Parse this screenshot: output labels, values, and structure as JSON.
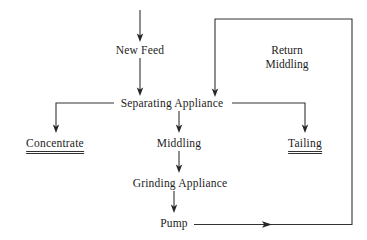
{
  "diagram": {
    "type": "flowchart",
    "background_color": "#ffffff",
    "line_color": "#333333",
    "text_color": "#1c1c1c",
    "nodes": {
      "new_feed": {
        "label": "New Feed",
        "x": 140,
        "y": 50
      },
      "separating_appliance": {
        "label": "Separating Appliance",
        "x": 172,
        "y": 104
      },
      "concentrate": {
        "label": "Concentrate",
        "x": 55,
        "y": 144,
        "style": "double-underline"
      },
      "middling": {
        "label": "Middling",
        "x": 179,
        "y": 144
      },
      "tailing": {
        "label": "Tailing",
        "x": 305,
        "y": 144,
        "style": "double-underline"
      },
      "grinding_appliance": {
        "label": "Grinding Appliance",
        "x": 180,
        "y": 184
      },
      "pump": {
        "label": "Pump",
        "x": 174,
        "y": 224
      },
      "return_middling": {
        "line1": "Return",
        "line2": "Middling",
        "x": 287,
        "y": 44
      }
    },
    "edges": [
      {
        "name": "inlet-to-new-feed",
        "from": "inlet",
        "to": "New Feed"
      },
      {
        "name": "new-feed-to-separating-appliance",
        "from": "New Feed",
        "to": "Separating Appliance"
      },
      {
        "name": "separating-appliance-to-concentrate",
        "from": "Separating Appliance",
        "to": "Concentrate"
      },
      {
        "name": "separating-appliance-to-middling",
        "from": "Separating Appliance",
        "to": "Middling"
      },
      {
        "name": "separating-appliance-to-tailing",
        "from": "Separating Appliance",
        "to": "Tailing"
      },
      {
        "name": "middling-to-grinding-appliance",
        "from": "Middling",
        "to": "Grinding Appliance"
      },
      {
        "name": "grinding-appliance-to-pump",
        "from": "Grinding Appliance",
        "to": "Pump"
      },
      {
        "name": "pump-return-loop",
        "from": "Pump",
        "to": "Separating Appliance",
        "label": "Return Middling"
      }
    ]
  }
}
